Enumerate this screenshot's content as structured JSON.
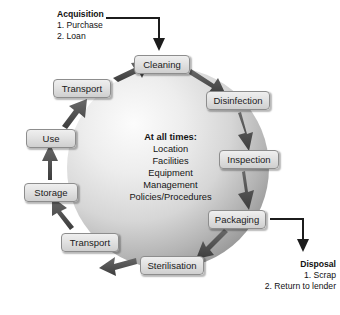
{
  "diagram": {
    "center": {
      "heading": "At all times:",
      "items": [
        "Location",
        "Facilities",
        "Equipment",
        "Management",
        "Policies/Procedures"
      ]
    },
    "cycle_nodes": [
      {
        "label": "Cleaning",
        "x": 134,
        "y": 55,
        "w": 56,
        "h": 19
      },
      {
        "label": "Disinfection",
        "x": 206,
        "y": 91,
        "w": 64,
        "h": 19
      },
      {
        "label": "Inspection",
        "x": 219,
        "y": 150,
        "w": 60,
        "h": 19
      },
      {
        "label": "Packaging",
        "x": 208,
        "y": 210,
        "w": 58,
        "h": 19
      },
      {
        "label": "Sterilisation",
        "x": 140,
        "y": 256,
        "w": 64,
        "h": 19
      },
      {
        "label": "Transport",
        "x": 61,
        "y": 233,
        "w": 58,
        "h": 19
      },
      {
        "label": "Storage",
        "x": 24,
        "y": 183,
        "w": 54,
        "h": 19
      },
      {
        "label": "Use",
        "x": 26,
        "y": 129,
        "w": 50,
        "h": 19
      },
      {
        "label": "Transport",
        "x": 53,
        "y": 79,
        "w": 58,
        "h": 19
      }
    ],
    "input": {
      "heading": "Acquisition",
      "items": [
        "1. Purchase",
        "2. Loan"
      ]
    },
    "output": {
      "heading": "Disposal",
      "items": [
        "1. Scrap",
        "2. Return to lender"
      ]
    },
    "colors": {
      "node_fill_top": "#efefef",
      "node_fill_bottom": "#cfcfcf",
      "node_border": "#8d8d8d",
      "arrow": "#4c4c4c",
      "connector": "#1c1c1c",
      "sphere_light": "#f2f2f2",
      "sphere_dark": "#9a9a9a",
      "text": "#151515"
    },
    "flow_direction": "clockwise"
  }
}
